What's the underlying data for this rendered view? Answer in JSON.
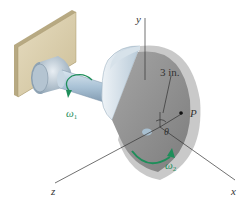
{
  "figure": {
    "type": "mechanics-diagram",
    "labels": {
      "axis_x": "x",
      "axis_y": "y",
      "axis_z": "z",
      "point": "P",
      "dimension": "3 in.",
      "angle": "θ",
      "omega1_symbol": "ω",
      "omega1_sub": "1",
      "omega2_symbol": "ω",
      "omega2_sub": "2"
    },
    "colors": {
      "wall": "#d9ccaa",
      "wall_edge": "#b7a982",
      "shaft": "#a9c2d6",
      "disk_face": "#8f8f8f",
      "disk_rim": "#c9c9c9",
      "arrow": "#1e8e5a",
      "axis_line": "#333333"
    }
  }
}
